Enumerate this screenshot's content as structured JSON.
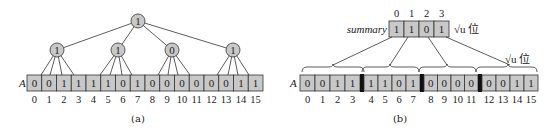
{
  "panel_a": {
    "array_label": "A",
    "bits": [
      "0",
      "0",
      "1",
      "1",
      "1",
      "1",
      "0",
      "1",
      "0",
      "0",
      "0",
      "0",
      "0",
      "0",
      "1",
      "1"
    ],
    "indices": [
      "0",
      "1",
      "2",
      "3",
      "4",
      "5",
      "6",
      "7",
      "8",
      "9",
      "10",
      "11",
      "12",
      "13",
      "14",
      "15"
    ],
    "root": "1",
    "level1": [
      "1",
      "1",
      "0",
      "1"
    ],
    "caption": "(a)"
  },
  "panel_b": {
    "summary_label": "summary",
    "summary_bits": [
      "1",
      "1",
      "0",
      "1"
    ],
    "summary_indices": [
      "0",
      "1",
      "2",
      "3"
    ],
    "summary_size_label": "√u 位",
    "cluster_size_label": "√u 位",
    "array_label": "A",
    "bits": [
      "0",
      "0",
      "1",
      "1",
      "1",
      "1",
      "0",
      "1",
      "0",
      "0",
      "0",
      "0",
      "0",
      "0",
      "1",
      "1"
    ],
    "indices": [
      "0",
      "1",
      "2",
      "3",
      "4",
      "5",
      "6",
      "7",
      "8",
      "9",
      "10",
      "11",
      "12",
      "13",
      "14",
      "15"
    ],
    "caption": "(b)"
  },
  "colors": {
    "cell_fill": "#c8c8c8",
    "stroke": "#333333",
    "separator": "#111111"
  }
}
